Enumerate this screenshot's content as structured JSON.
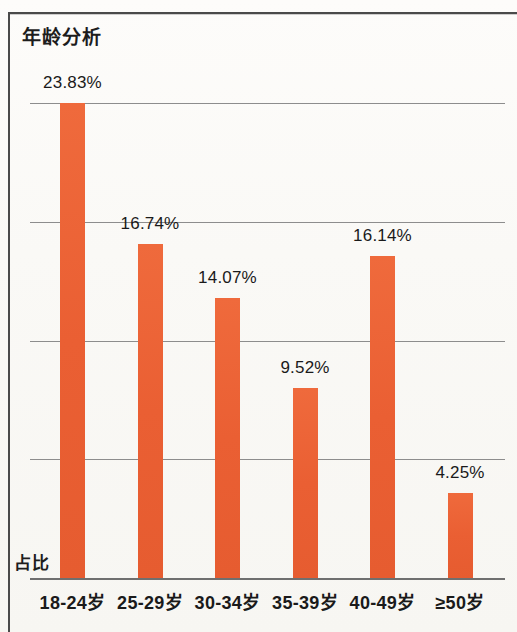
{
  "chart_data": {
    "type": "bar",
    "title": "年龄分析",
    "xlabel": "",
    "ylabel": "占比",
    "categories": [
      "18-24岁",
      "25-29岁",
      "30-34岁",
      "35-39岁",
      "40-49岁",
      "≥50岁"
    ],
    "values": [
      23.83,
      16.74,
      14.07,
      9.52,
      16.14,
      4.25
    ],
    "value_labels": [
      "23.83%",
      "16.74%",
      "14.07%",
      "9.52%",
      "16.14%",
      "4.25%"
    ],
    "unit": "%",
    "ylim": [
      0,
      23.83
    ],
    "grid": true,
    "gridline_count": 4,
    "legend": "none",
    "bar_color": "#ea5f33",
    "axis_color": "#6f6f6f",
    "gridline_color": "#8d8d8d",
    "text_color": "#1a1a1a"
  },
  "figure": {
    "frame_color": "#4a4a4a",
    "background_color": "#faf9f6"
  }
}
